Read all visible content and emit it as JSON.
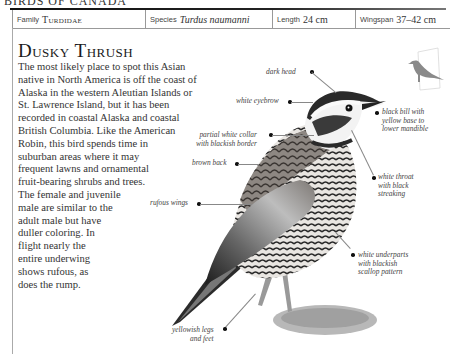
{
  "running_head": "BIRDS OF CANADA",
  "info_bar": {
    "family_label": "Family",
    "family_value": "Turdidae",
    "species_label": "Species",
    "species_value": "Turdus naumanni",
    "length_label": "Length",
    "length_value": "24 cm",
    "wingspan_label": "Wingspan",
    "wingspan_value": "37–42 cm"
  },
  "title": "Dusky Thrush",
  "body_lines": [
    "The most likely place to spot this Asian",
    "native in North America is off the coast of",
    "Alaska in the western Aleutian Islands or",
    "St. Lawrence Island, but it has been",
    "recorded in coastal Alaska and coastal",
    "British Columbia. Like the American",
    "Robin, this bird spends time in",
    "suburban areas where it may",
    "frequent lawns and ornamental",
    "fruit-bearing shrubs and trees.",
    "The female and juvenile",
    "male are similar to the",
    "adult male but have",
    "duller coloring. In",
    "flight nearly the",
    "entire underwing",
    "shows rufous, as",
    "does the rump."
  ],
  "annotations": {
    "dark_head": "dark head",
    "white_eyebrow": "white eyebrow",
    "collar_1": "partial white collar",
    "collar_2": "with blackish border",
    "brown_back": "brown back",
    "rufous_wings": "rufous wings",
    "bill_1": "black bill with",
    "bill_2": "yellow base to",
    "bill_3": "lower mandible",
    "throat_1": "white throat",
    "throat_2": "with black",
    "throat_3": "streaking",
    "under_1": "white underparts",
    "under_2": "with blackish",
    "under_3": "scallop pattern",
    "legs_1": "yellowish legs",
    "legs_2": "and feet"
  },
  "icons": {
    "bird_illustration": "dusky-thrush-illustration",
    "size_silhouette": "bird-size-silhouette-icon"
  },
  "colors": {
    "text": "#333333",
    "rule": "#111111",
    "border": "#999999",
    "silhouette": "#8a8a8a"
  }
}
